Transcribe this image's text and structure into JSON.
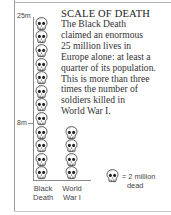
{
  "chart_data": {
    "type": "pictograph",
    "title": "SCALE OF DEATH",
    "description_lines": [
      "The Black Death",
      "claimed an enormous",
      "25 million lives in",
      "Europe alone: at least a",
      "quarter of its population.",
      "This is more than three",
      "times the number of",
      "soldiers killed in",
      "World War I."
    ],
    "categories": [
      "Black Death",
      "World War I"
    ],
    "category_labels": [
      {
        "line1": "Black",
        "line2": "Death"
      },
      {
        "line1": "World",
        "line2": "War I"
      }
    ],
    "values": [
      25,
      8
    ],
    "unit": "million dead",
    "icon_counts": [
      12,
      4
    ],
    "y_ticks": [
      {
        "label": "25m",
        "value": 25
      },
      {
        "label": "8m",
        "value": 8
      }
    ],
    "legend": {
      "icon": "skull-icon",
      "line1": "= 2 million",
      "line2": "dead",
      "value_per_icon": 2
    }
  }
}
